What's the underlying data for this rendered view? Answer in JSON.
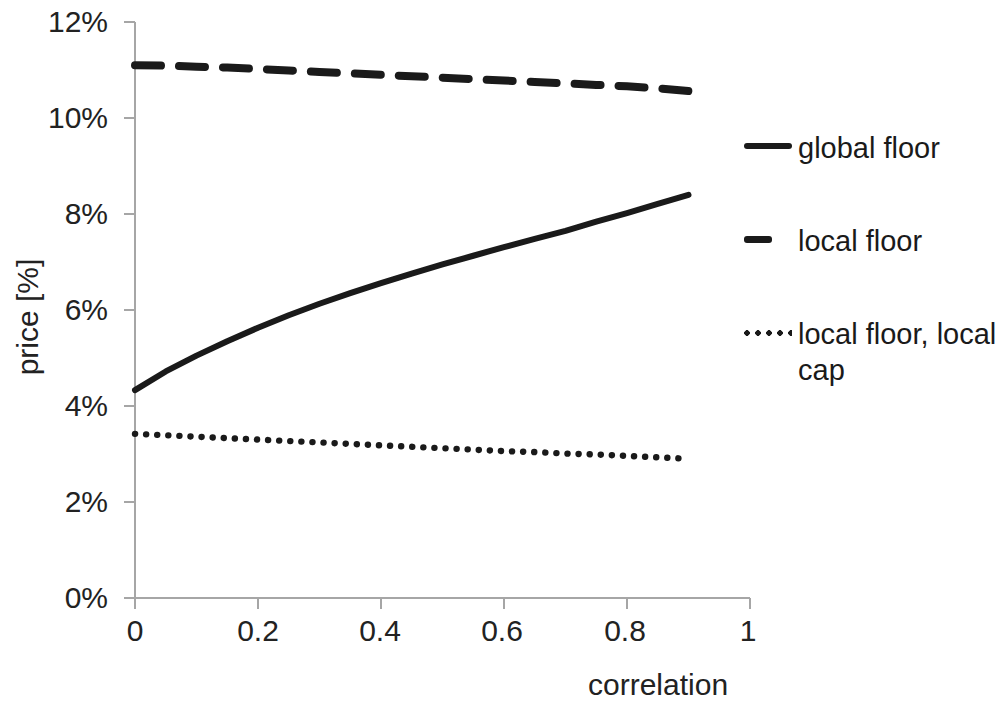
{
  "chart_data": {
    "type": "line",
    "title": "",
    "xlabel": "correlation",
    "ylabel": "price [%]",
    "xlim": [
      0,
      1
    ],
    "ylim": [
      0,
      12
    ],
    "grid": false,
    "legend_position": "right",
    "x_tick_labels": [
      "0",
      "0.2",
      "0.4",
      "0.6",
      "0.8",
      "1"
    ],
    "x_tick_values": [
      0,
      0.2,
      0.4,
      0.6,
      0.8,
      1
    ],
    "y_tick_labels": [
      "0%",
      "2%",
      "4%",
      "6%",
      "8%",
      "10%",
      "12%"
    ],
    "y_tick_values": [
      0,
      2,
      4,
      6,
      8,
      10,
      12
    ],
    "x": [
      0,
      0.05,
      0.1,
      0.15,
      0.2,
      0.25,
      0.3,
      0.35,
      0.4,
      0.45,
      0.5,
      0.55,
      0.6,
      0.65,
      0.7,
      0.75,
      0.8,
      0.85,
      0.9
    ],
    "series": [
      {
        "name": "global floor",
        "style": "solid",
        "color": "#1a1a1a",
        "values": [
          4.33,
          4.72,
          5.05,
          5.35,
          5.63,
          5.89,
          6.13,
          6.35,
          6.56,
          6.76,
          6.95,
          7.13,
          7.31,
          7.48,
          7.65,
          7.84,
          8.02,
          8.21,
          8.4
        ]
      },
      {
        "name": "local floor",
        "style": "dashed",
        "color": "#1a1a1a",
        "values": [
          11.1,
          11.09,
          11.07,
          11.05,
          11.02,
          10.99,
          10.96,
          10.93,
          10.9,
          10.87,
          10.84,
          10.81,
          10.78,
          10.75,
          10.72,
          10.69,
          10.66,
          10.62,
          10.56
        ]
      },
      {
        "name": "local floor, local cap",
        "style": "dotted",
        "color": "#1a1a1a",
        "values": [
          3.42,
          3.39,
          3.36,
          3.33,
          3.3,
          3.27,
          3.24,
          3.21,
          3.18,
          3.15,
          3.12,
          3.09,
          3.06,
          3.04,
          3.01,
          2.99,
          2.96,
          2.93,
          2.9
        ]
      }
    ]
  },
  "axes": {
    "y_title": "price [%]",
    "x_title": "correlation",
    "y_ticks": [
      "12%",
      "10%",
      "8%",
      "6%",
      "4%",
      "2%",
      "0%"
    ],
    "x_ticks": [
      "0",
      "0.2",
      "0.4",
      "0.6",
      "0.8",
      "1"
    ]
  },
  "legend": {
    "items": [
      {
        "label": "global floor",
        "style": "solid"
      },
      {
        "label": "local floor",
        "style": "dashed"
      },
      {
        "label": "local floor, local cap",
        "style": "dotted"
      }
    ]
  },
  "colors": {
    "line": "#1a1a1a",
    "axis": "#a6a6a6",
    "text": "#222222",
    "background": "#ffffff"
  }
}
